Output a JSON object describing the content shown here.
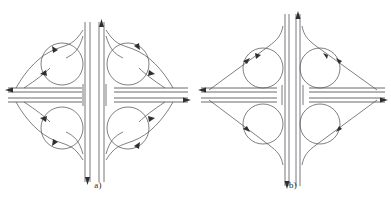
{
  "figure": {
    "type": "technical-diagram",
    "background_color": "#ffffff",
    "line_color": "#555558",
    "arrow_color": "#2f2f33",
    "panel_count": 2
  },
  "panels": [
    {
      "id": "a",
      "caption": "a)",
      "name": "cloverleaf-interchange-curved-ramps",
      "description": "Full cloverleaf interchange with four circular loop ramps and outward-flaring curved directional ramps forming a quatrefoil outline",
      "loop_ramp_count": 4,
      "mainline_vertical": "dual carriageway, overpass",
      "mainline_horizontal": "dual carriageway, underpass",
      "arrows": [
        {
          "at": "top",
          "direction": "up",
          "lane": "right"
        },
        {
          "at": "bottom",
          "direction": "down",
          "lane": "left"
        },
        {
          "at": "left",
          "direction": "left",
          "lane": "upper"
        },
        {
          "at": "right",
          "direction": "right",
          "lane": "lower"
        }
      ]
    },
    {
      "id": "b",
      "caption": "b)",
      "name": "diamond-interchange-straight-ramps",
      "description": "Interchange with four circular loop ramps and straight diagonal directional ramps forming a rhombus outline",
      "loop_ramp_count": 4,
      "mainline_vertical": "dual carriageway, overpass",
      "mainline_horizontal": "dual carriageway, underpass",
      "arrows": [
        {
          "at": "top",
          "direction": "up",
          "lane": "right"
        },
        {
          "at": "bottom",
          "direction": "down",
          "lane": "left"
        },
        {
          "at": "left",
          "direction": "left",
          "lane": "upper"
        },
        {
          "at": "right",
          "direction": "right",
          "lane": "lower"
        }
      ]
    }
  ]
}
